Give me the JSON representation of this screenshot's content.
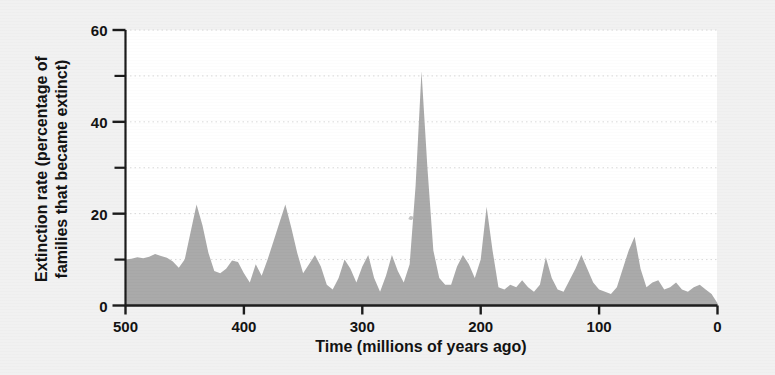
{
  "chart_data": {
    "type": "area",
    "title": "",
    "xlabel": "Time  (millions of years ago)",
    "ylabel_line1": "Extinction rate (percentage of",
    "ylabel_line2": "families that became extinct)",
    "xlim": [
      500,
      0
    ],
    "ylim": [
      0,
      60
    ],
    "x_reversed": true,
    "grid": true,
    "grid_style": "dotted-horizontal",
    "legend": "none",
    "x_major_ticks": [
      500,
      400,
      300,
      200,
      100,
      0
    ],
    "x_tick_labels": [
      "500",
      "400",
      "300",
      "200",
      "100",
      "0"
    ],
    "y_major_ticks": [
      0,
      20,
      40,
      60
    ],
    "y_tick_labels": [
      "0",
      "20",
      "40",
      "60"
    ],
    "y_minor_ticks": [
      10,
      30,
      50
    ],
    "area_fill_color": "#a9a9a9",
    "plot_background_color": "#ffffff",
    "figure_background_color": "#f1f1f1",
    "axis_color": "#1a1a1a",
    "gridline_color": "#d8d8d8",
    "annotation_note": "small scan speck near x=290, y=17",
    "series": [
      {
        "name": "Extinction rate",
        "x": [
          500,
          495,
          490,
          485,
          480,
          475,
          470,
          465,
          460,
          455,
          450,
          445,
          440,
          435,
          430,
          425,
          420,
          415,
          410,
          405,
          400,
          395,
          390,
          385,
          380,
          375,
          370,
          365,
          360,
          355,
          350,
          345,
          340,
          335,
          330,
          325,
          320,
          315,
          310,
          305,
          300,
          295,
          290,
          285,
          280,
          275,
          270,
          265,
          260,
          255,
          250,
          245,
          240,
          235,
          230,
          225,
          220,
          215,
          210,
          205,
          200,
          195,
          190,
          185,
          180,
          175,
          170,
          165,
          160,
          155,
          150,
          145,
          140,
          135,
          130,
          125,
          120,
          115,
          110,
          105,
          100,
          95,
          90,
          85,
          80,
          75,
          70,
          65,
          60,
          55,
          50,
          45,
          40,
          35,
          30,
          25,
          20,
          15,
          10,
          5,
          0
        ],
        "y": [
          10,
          10.2,
          10.5,
          10.3,
          10.6,
          11.2,
          10.8,
          10.4,
          9.6,
          8.2,
          10.0,
          16.0,
          22.0,
          17.5,
          11.5,
          7.5,
          7.0,
          8.0,
          9.8,
          9.5,
          7.0,
          5.0,
          9.0,
          6.5,
          10.0,
          14.0,
          18.0,
          22.0,
          17.0,
          11.5,
          7.0,
          9.0,
          11.0,
          8.5,
          4.5,
          3.5,
          6.0,
          10.0,
          8.0,
          5.0,
          8.5,
          11.0,
          6.0,
          3.0,
          6.5,
          11.0,
          7.5,
          5.0,
          9.0,
          26.0,
          51.0,
          30.0,
          12.0,
          6.0,
          4.5,
          4.5,
          8.5,
          11.0,
          9.0,
          6.0,
          10.0,
          21.5,
          12.0,
          4.0,
          3.5,
          4.5,
          4.0,
          5.5,
          4.0,
          3.0,
          4.5,
          10.5,
          6.0,
          3.5,
          3.0,
          5.5,
          8.0,
          11.0,
          8.0,
          5.0,
          3.5,
          3.0,
          2.5,
          4.0,
          8.0,
          12.0,
          15.0,
          8.0,
          4.0,
          5.0,
          5.5,
          3.5,
          4.0,
          5.0,
          3.5,
          3.0,
          4.0,
          4.5,
          3.5,
          2.5,
          0.5
        ]
      }
    ]
  },
  "axes": {
    "y_ticks": [
      {
        "value": 60,
        "label": "60",
        "major": true
      },
      {
        "value": 50,
        "label": "",
        "major": false
      },
      {
        "value": 40,
        "label": "40",
        "major": true
      },
      {
        "value": 30,
        "label": "",
        "major": false
      },
      {
        "value": 20,
        "label": "20",
        "major": true
      },
      {
        "value": 10,
        "label": "",
        "major": false
      },
      {
        "value": 0,
        "label": "0",
        "major": true
      }
    ],
    "x_ticks": [
      {
        "value": 500,
        "label": "500"
      },
      {
        "value": 400,
        "label": "400"
      },
      {
        "value": 300,
        "label": "300"
      },
      {
        "value": 200,
        "label": "200"
      },
      {
        "value": 100,
        "label": "100"
      },
      {
        "value": 0,
        "label": "0"
      }
    ]
  }
}
